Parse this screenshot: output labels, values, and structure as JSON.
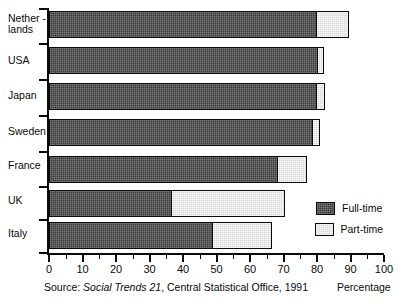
{
  "chart_data": {
    "type": "bar",
    "orientation": "horizontal",
    "stacked": true,
    "title": "",
    "subtitle": "",
    "xlabel": "Percentage",
    "ylabel": "",
    "xlim": [
      0,
      100
    ],
    "xticks": [
      0,
      10,
      20,
      30,
      40,
      50,
      60,
      70,
      80,
      90,
      100
    ],
    "xtick_labels": [
      "0",
      "10",
      "20",
      "30",
      "40",
      "50",
      "60",
      "70",
      "80",
      "90",
      "100"
    ],
    "minor_ticks": true,
    "grid": false,
    "legend_position": "right-inside",
    "categories": [
      "Nether -\nlands",
      "USA",
      "Japan",
      "Sweden",
      "France",
      "UK",
      "Italy"
    ],
    "series": [
      {
        "name": "Full-time",
        "color": "#3b3b3b",
        "values": [
          80,
          80.5,
          80,
          79,
          68.5,
          37,
          49
        ]
      },
      {
        "name": "Part-time",
        "color": "#d6d6d6",
        "values": [
          9.5,
          1.5,
          2.5,
          2,
          8.5,
          33.5,
          17.5
        ]
      }
    ],
    "totals": [
      89.5,
      82,
      82.5,
      81,
      77,
      70.5,
      66.5
    ],
    "annotations": [
      "Source: Social Trends 21, Central Statistical Office, 1991"
    ]
  },
  "legend": {
    "items": [
      {
        "label": "Full-time",
        "swatch": "dark-hatch-swatch"
      },
      {
        "label": "Part-time",
        "swatch": "light-hatch-swatch"
      }
    ]
  },
  "footer": {
    "source_prefix": "Source: ",
    "source_italic": "Social Trends 21",
    "source_suffix": ", Central Statistical Office, 1991",
    "axis_title": "Percentage"
  }
}
